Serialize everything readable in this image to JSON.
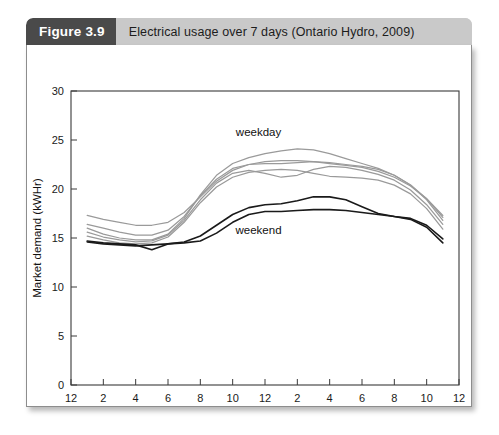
{
  "figure": {
    "number_label": "Figure 3.9",
    "title": "Electrical usage over 7 days (Ontario Hydro, 2009)"
  },
  "chart_data": {
    "type": "line",
    "title": "Electrical usage over 7 days (Ontario Hydro, 2009)",
    "xlabel": "Time (hour)",
    "ylabel": "Market demand (kWHr)",
    "xlim": [
      0,
      24
    ],
    "ylim": [
      0,
      30
    ],
    "yticks": [
      0,
      5,
      10,
      15,
      20,
      25,
      30
    ],
    "ytick_labels": [
      "0",
      "5",
      "10",
      "15",
      "20",
      "25",
      "30"
    ],
    "xticks": [
      0,
      2,
      4,
      6,
      8,
      10,
      12,
      14,
      16,
      18,
      20,
      22,
      24
    ],
    "xtick_labels": [
      "12",
      "2",
      "4",
      "6",
      "8",
      "10",
      "12",
      "2",
      "4",
      "6",
      "8",
      "10",
      "12"
    ],
    "grid": false,
    "legend": "none",
    "annotations": [
      {
        "text": "weekday",
        "x": 11.6,
        "y": 25.4
      },
      {
        "text": "weekend",
        "x": 11.6,
        "y": 15.4
      }
    ],
    "x": [
      1,
      2,
      3,
      4,
      5,
      6,
      7,
      8,
      9,
      10,
      11,
      12,
      13,
      14,
      15,
      16,
      17,
      18,
      19,
      20,
      21,
      22,
      23
    ],
    "series": [
      {
        "name": "weekday-1",
        "group": "weekday",
        "color": "#9a9a9a",
        "values": [
          17.3,
          16.9,
          16.6,
          16.3,
          16.3,
          16.6,
          17.6,
          19.2,
          20.8,
          21.9,
          22.5,
          22.8,
          22.9,
          22.9,
          22.8,
          22.6,
          22.4,
          22.2,
          21.8,
          21.2,
          20.3,
          19.0,
          17.3
        ]
      },
      {
        "name": "weekday-2",
        "group": "weekday",
        "color": "#9a9a9a",
        "values": [
          16.4,
          16.0,
          15.6,
          15.3,
          15.3,
          15.8,
          17.2,
          19.3,
          21.0,
          22.1,
          22.5,
          22.6,
          22.6,
          22.7,
          22.8,
          22.7,
          22.5,
          22.3,
          22.0,
          21.4,
          20.4,
          19.0,
          17.1
        ]
      },
      {
        "name": "weekday-3",
        "group": "weekday",
        "color": "#9a9a9a",
        "values": [
          16.0,
          15.4,
          15.0,
          14.8,
          14.8,
          15.4,
          17.0,
          19.4,
          21.4,
          22.6,
          23.2,
          23.6,
          23.9,
          24.1,
          24.0,
          23.6,
          23.1,
          22.6,
          22.1,
          21.4,
          20.4,
          18.9,
          16.8
        ]
      },
      {
        "name": "weekday-4",
        "group": "weekday",
        "color": "#9a9a9a",
        "values": [
          15.6,
          15.1,
          14.8,
          14.6,
          14.7,
          15.3,
          16.8,
          18.9,
          20.6,
          21.6,
          21.9,
          21.6,
          21.2,
          21.4,
          22.0,
          22.3,
          22.2,
          21.9,
          21.5,
          20.9,
          19.9,
          18.4,
          16.4
        ]
      },
      {
        "name": "weekday-5",
        "group": "weekday",
        "color": "#9a9a9a",
        "values": [
          15.2,
          14.8,
          14.5,
          14.4,
          14.5,
          15.1,
          16.6,
          18.6,
          20.2,
          21.2,
          21.7,
          21.9,
          22.0,
          21.9,
          21.6,
          21.3,
          21.2,
          21.1,
          20.9,
          20.4,
          19.5,
          18.0,
          15.9
        ]
      },
      {
        "name": "weekend-1",
        "group": "weekend",
        "color": "#1a1a1a",
        "values": [
          14.7,
          14.5,
          14.4,
          14.3,
          13.8,
          14.4,
          14.6,
          15.2,
          16.3,
          17.4,
          18.1,
          18.4,
          18.5,
          18.8,
          19.2,
          19.2,
          18.9,
          18.2,
          17.5,
          17.2,
          17.0,
          16.3,
          14.9
        ]
      },
      {
        "name": "weekend-2",
        "group": "weekend",
        "color": "#1a1a1a",
        "values": [
          14.6,
          14.4,
          14.3,
          14.2,
          14.3,
          14.4,
          14.5,
          14.7,
          15.5,
          16.6,
          17.4,
          17.7,
          17.7,
          17.8,
          17.9,
          17.9,
          17.8,
          17.6,
          17.4,
          17.2,
          16.9,
          16.1,
          14.5
        ]
      }
    ]
  }
}
